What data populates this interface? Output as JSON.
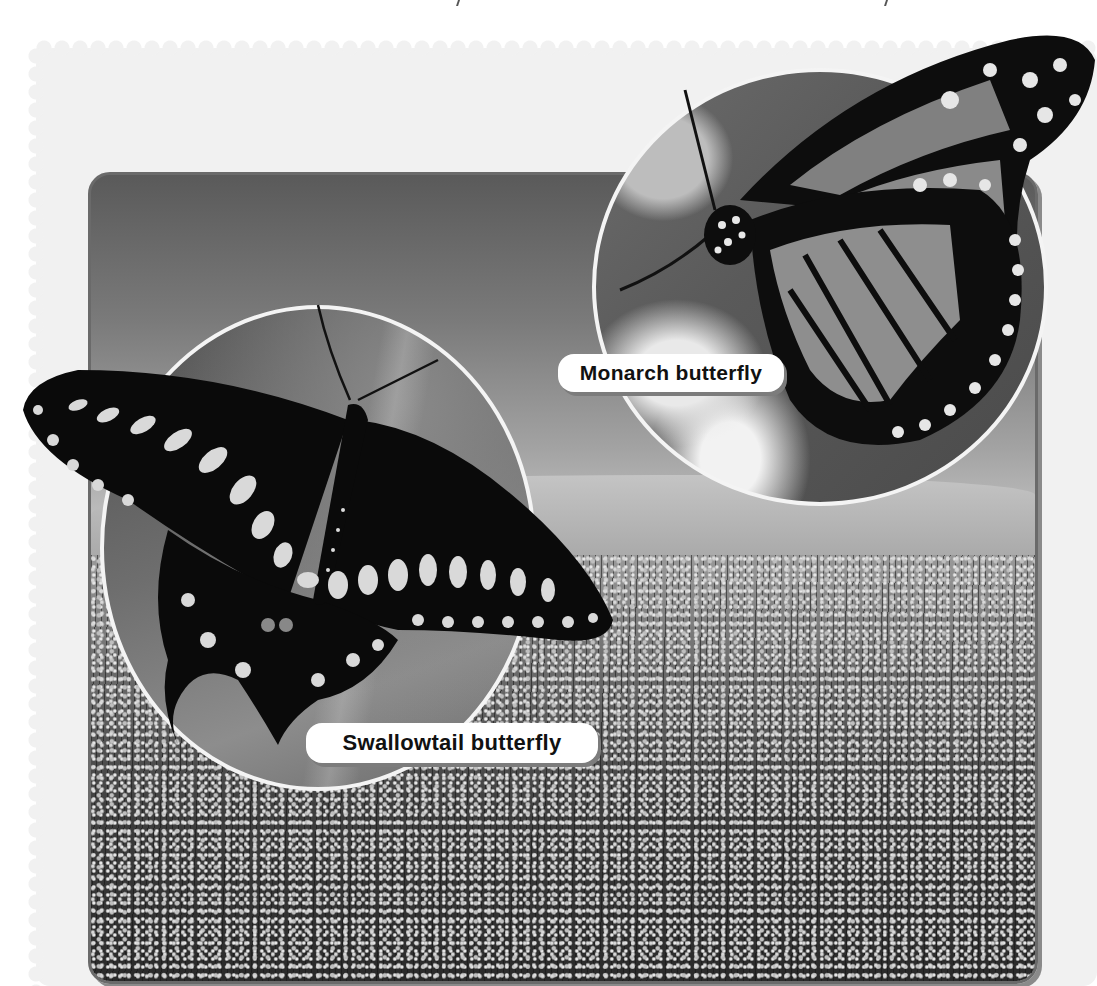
{
  "page": {
    "background": "#ffffff",
    "panel_color": "#f1f1f1",
    "color_mode": "grayscale"
  },
  "photo": {
    "scene": "flower-field-landscape",
    "frame_border_color": "#6a6a6a"
  },
  "insets": [
    {
      "id": "monarch",
      "label": "Monarch butterfly"
    },
    {
      "id": "swallowtail",
      "label": "Swallowtail butterfly"
    }
  ]
}
